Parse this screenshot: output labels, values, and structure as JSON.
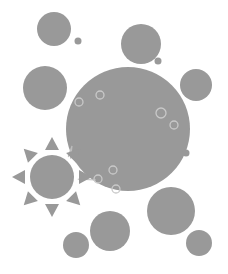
{
  "illustration": {
    "description": "Gray circles (planets/bubbles) with a sun icon",
    "colors": {
      "fill": "#999999",
      "ring": "#c9c9c9",
      "background": "#ffffff",
      "line": "#bdbdbd"
    },
    "big_circle": {
      "cx": 128,
      "cy": 129,
      "r": 62
    },
    "circles": [
      {
        "name": "top-left-circle",
        "cx": 54,
        "cy": 29,
        "r": 17
      },
      {
        "name": "top-center-circle",
        "cx": 141,
        "cy": 44,
        "r": 20
      },
      {
        "name": "left-circle",
        "cx": 45,
        "cy": 88,
        "r": 22
      },
      {
        "name": "right-circle",
        "cx": 196,
        "cy": 85,
        "r": 16
      },
      {
        "name": "lower-right-circle",
        "cx": 171,
        "cy": 211,
        "r": 24
      },
      {
        "name": "bottom-right-circle",
        "cx": 199,
        "cy": 243,
        "r": 13
      },
      {
        "name": "bottom-center-circle",
        "cx": 110,
        "cy": 231,
        "r": 20
      },
      {
        "name": "bottom-left-circle",
        "cx": 76,
        "cy": 245,
        "r": 13
      }
    ],
    "dots": [
      {
        "name": "dot-top-left",
        "cx": 78,
        "cy": 41,
        "r": 3.5
      },
      {
        "name": "dot-top-center",
        "cx": 158,
        "cy": 61,
        "r": 3.5
      },
      {
        "name": "dot-right-edge",
        "cx": 186,
        "cy": 153,
        "r": 3.5
      }
    ],
    "rings": [
      {
        "cx": 79,
        "cy": 102,
        "r": 4
      },
      {
        "cx": 100,
        "cy": 95,
        "r": 4
      },
      {
        "cx": 161,
        "cy": 113,
        "r": 5
      },
      {
        "cx": 174,
        "cy": 125,
        "r": 4
      },
      {
        "cx": 113,
        "cy": 170,
        "r": 4
      },
      {
        "cx": 98,
        "cy": 179,
        "r": 4
      },
      {
        "cx": 116,
        "cy": 189,
        "r": 4
      }
    ],
    "sun": {
      "cx": 52,
      "cy": 177,
      "r": 22,
      "ray_count": 8,
      "ray_inner": 27,
      "ray_outer": 40,
      "ray_half_width": 7
    }
  }
}
